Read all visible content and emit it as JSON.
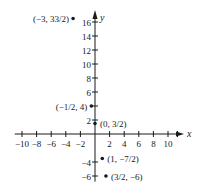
{
  "chart_data": {
    "type": "scatter",
    "title": "",
    "xlabel": "x",
    "ylabel": "y",
    "xlim": [
      -11,
      12
    ],
    "ylim": [
      -7,
      17
    ],
    "grid": false,
    "legend": null,
    "x_ticks": [
      -10,
      -8,
      -6,
      -4,
      -2,
      2,
      4,
      6,
      8,
      10
    ],
    "x_tick_labels": [
      "−10",
      "−8",
      "−6",
      "−4",
      "−2",
      "2",
      "4",
      "6",
      "8",
      "10"
    ],
    "y_ticks": [
      -6,
      -4,
      2,
      4,
      6,
      8,
      10,
      12,
      14,
      16
    ],
    "y_tick_labels": [
      "−6",
      "−4",
      "2",
      "",
      "6",
      "8",
      "10",
      "12",
      "14",
      "16"
    ],
    "points": [
      {
        "x": -3,
        "y": 16.5,
        "label": "(−3, 33/2)",
        "label_side": "left"
      },
      {
        "x": -0.5,
        "y": 4,
        "label": "(−1/2, 4)",
        "label_side": "left"
      },
      {
        "x": 0,
        "y": 1.5,
        "label": "(0, 3/2)",
        "label_side": "right"
      },
      {
        "x": 1,
        "y": -3.5,
        "label": "(1, −7/2)",
        "label_side": "right"
      },
      {
        "x": 1.5,
        "y": -6,
        "label": "(3/2, −6)",
        "label_side": "right"
      }
    ],
    "colors": {
      "axis": "#1a1a1a",
      "point": "#1a1a1a",
      "background": "#ffffff"
    }
  },
  "layout": {
    "origin_px": [
      95,
      134
    ],
    "x_unit_px": 7.3,
    "y_unit_px": 7.0
  }
}
